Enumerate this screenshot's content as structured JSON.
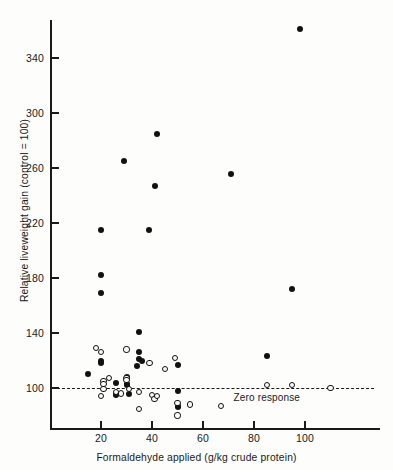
{
  "chart_data": {
    "type": "scatter",
    "title": "",
    "xlabel": "Formaldehyde applied (g/kg crude protein)",
    "ylabel": "Relative liveweight gain (control = 100)",
    "xlim": [
      0,
      118
    ],
    "ylim": [
      68,
      368
    ],
    "xticks": [
      20,
      40,
      60,
      80,
      100
    ],
    "yticks": [
      100,
      140,
      180,
      220,
      260,
      300,
      340
    ],
    "grid": false,
    "legend_position": "none",
    "annotations": [
      {
        "text": "Zero response",
        "x": 72,
        "y": 93
      }
    ],
    "reference_lines": [
      {
        "label": "Zero response",
        "y": 100,
        "style": "dashed",
        "color": "#1a1a1a"
      }
    ],
    "series": [
      {
        "name": "filled-circles",
        "marker": "filled-circle",
        "color": "#111111",
        "points": [
          [
            98,
            361
          ],
          [
            42,
            285
          ],
          [
            29,
            265
          ],
          [
            41,
            247
          ],
          [
            71,
            256
          ],
          [
            20,
            215
          ],
          [
            39,
            215
          ],
          [
            20,
            182
          ],
          [
            20,
            169
          ],
          [
            35,
            141
          ],
          [
            15,
            110
          ],
          [
            20,
            120
          ],
          [
            20,
            118
          ],
          [
            26,
            104
          ],
          [
            30,
            108
          ],
          [
            30,
            103
          ],
          [
            30,
            102
          ],
          [
            31,
            96
          ],
          [
            26,
            96
          ],
          [
            26,
            95
          ],
          [
            34,
            116
          ],
          [
            35,
            126
          ],
          [
            35,
            121
          ],
          [
            36,
            120
          ],
          [
            50,
            117
          ],
          [
            50,
            98
          ],
          [
            50,
            87
          ],
          [
            50,
            86
          ],
          [
            85,
            123
          ],
          [
            95,
            172
          ]
        ]
      },
      {
        "name": "open-circles",
        "marker": "open-circle",
        "color": "#111111",
        "points": [
          [
            18,
            129
          ],
          [
            20,
            126
          ],
          [
            20,
            94
          ],
          [
            21,
            105
          ],
          [
            21,
            103
          ],
          [
            21,
            99
          ],
          [
            23,
            107
          ],
          [
            26,
            97
          ],
          [
            28,
            96
          ],
          [
            30,
            128
          ],
          [
            30,
            107
          ],
          [
            30,
            106
          ],
          [
            31,
            99
          ],
          [
            35,
            97
          ],
          [
            35,
            85
          ],
          [
            39,
            118
          ],
          [
            40,
            95
          ],
          [
            41,
            92
          ],
          [
            42,
            94
          ],
          [
            45,
            114
          ],
          [
            49,
            122
          ],
          [
            50,
            89
          ],
          [
            50,
            80
          ],
          [
            55,
            88
          ],
          [
            67,
            87
          ],
          [
            85,
            102
          ],
          [
            95,
            102
          ],
          [
            110,
            100
          ]
        ]
      }
    ]
  }
}
